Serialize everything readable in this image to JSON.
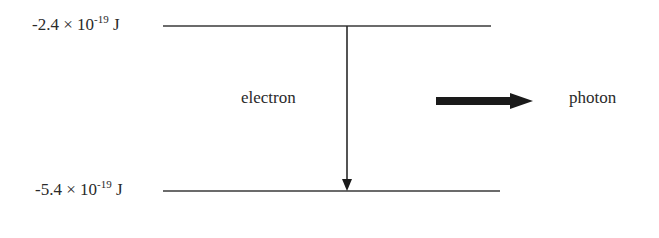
{
  "diagram": {
    "levels": [
      {
        "id": "upper",
        "mantissa": "-2.4",
        "times": "×",
        "base": "10",
        "exponent": "-19",
        "unit": "J",
        "y": 26,
        "x1": 163,
        "x2": 491
      },
      {
        "id": "lower",
        "mantissa": "-5.4",
        "times": "×",
        "base": "10",
        "exponent": "-19",
        "unit": "J",
        "y": 191,
        "x1": 163,
        "x2": 500
      }
    ],
    "transition": {
      "label": "electron",
      "x": 347,
      "from_y": 26,
      "to_y": 191
    },
    "emission": {
      "label": "photon",
      "x1": 436,
      "x2": 533,
      "y": 101
    },
    "colors": {
      "line": "#3a3a3a",
      "arrow": "#1a1a1a",
      "text": "#2a2a2a"
    }
  }
}
